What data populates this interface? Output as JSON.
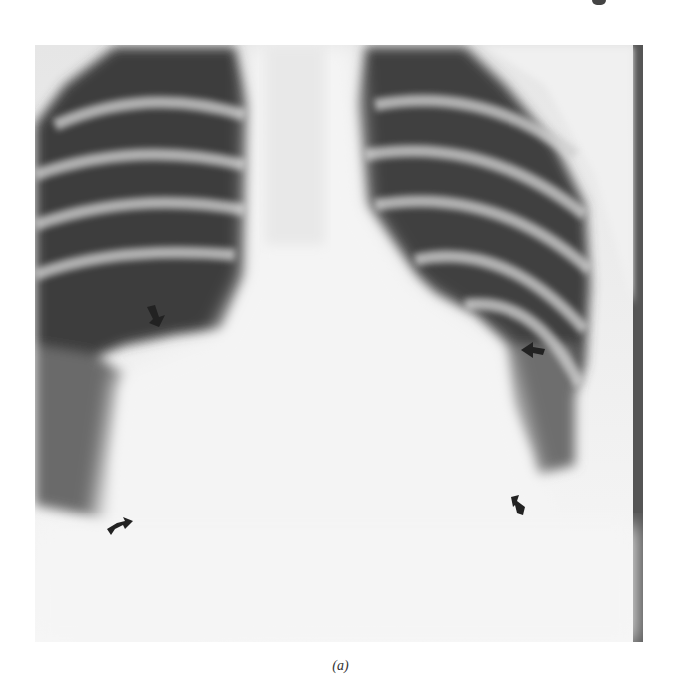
{
  "figure": {
    "type": "chest-radiograph",
    "view": "frontal",
    "caption": "(a)",
    "arrows": [
      {
        "name": "right-hilar-arrow",
        "x": 122,
        "y": 272,
        "direction": "down-right"
      },
      {
        "name": "left-heart-border-arrow",
        "x": 498,
        "y": 305,
        "direction": "left"
      },
      {
        "name": "right-cardiophrenic-arrow",
        "x": 86,
        "y": 478,
        "direction": "right"
      },
      {
        "name": "left-lower-arrow",
        "x": 482,
        "y": 462,
        "direction": "up-left"
      }
    ],
    "colors": {
      "background": "#ffffff",
      "lung": "#3a3a3a",
      "soft_tissue": "#f2f2f2",
      "arrow": "#222222"
    }
  }
}
